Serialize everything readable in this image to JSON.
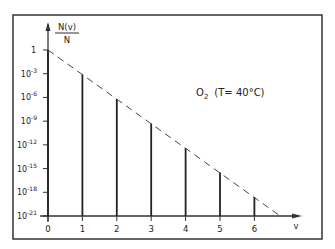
{
  "chart_data": {
    "type": "bar",
    "title": "",
    "annotation": {
      "species": "O",
      "subscript": "2",
      "condition": "(T= 40°C)"
    },
    "xlabel": "v",
    "ylabel_numerator": "N(v)",
    "ylabel_denominator": "N",
    "yscale": "log",
    "categories": [
      0,
      1,
      2,
      3,
      4,
      5,
      6
    ],
    "values_log10": [
      0,
      -3.1,
      -6.2,
      -9.3,
      -12.4,
      -15.5,
      -18.6
    ],
    "x_ticks": [
      "0",
      "1",
      "2",
      "3",
      "4",
      "5",
      "6"
    ],
    "y_ticks": [
      {
        "exp": null,
        "label": "1",
        "log10": 0
      },
      {
        "exp": "-3",
        "label": "10",
        "log10": -3
      },
      {
        "exp": "-6",
        "label": "10",
        "log10": -6
      },
      {
        "exp": "-9",
        "label": "10",
        "log10": -9
      },
      {
        "exp": "-12",
        "label": "10",
        "log10": -12
      },
      {
        "exp": "-15",
        "label": "10",
        "log10": -15
      },
      {
        "exp": "-18",
        "label": "10",
        "log10": -18
      },
      {
        "exp": "-21",
        "label": "10",
        "log10": -21
      }
    ],
    "ylim_log10": [
      -21,
      0
    ],
    "xlim": [
      0,
      7
    ],
    "trend_line": {
      "style": "dashed",
      "from": [
        0,
        0
      ],
      "to": [
        6.75,
        -21
      ]
    },
    "grid": false,
    "legend": null
  }
}
